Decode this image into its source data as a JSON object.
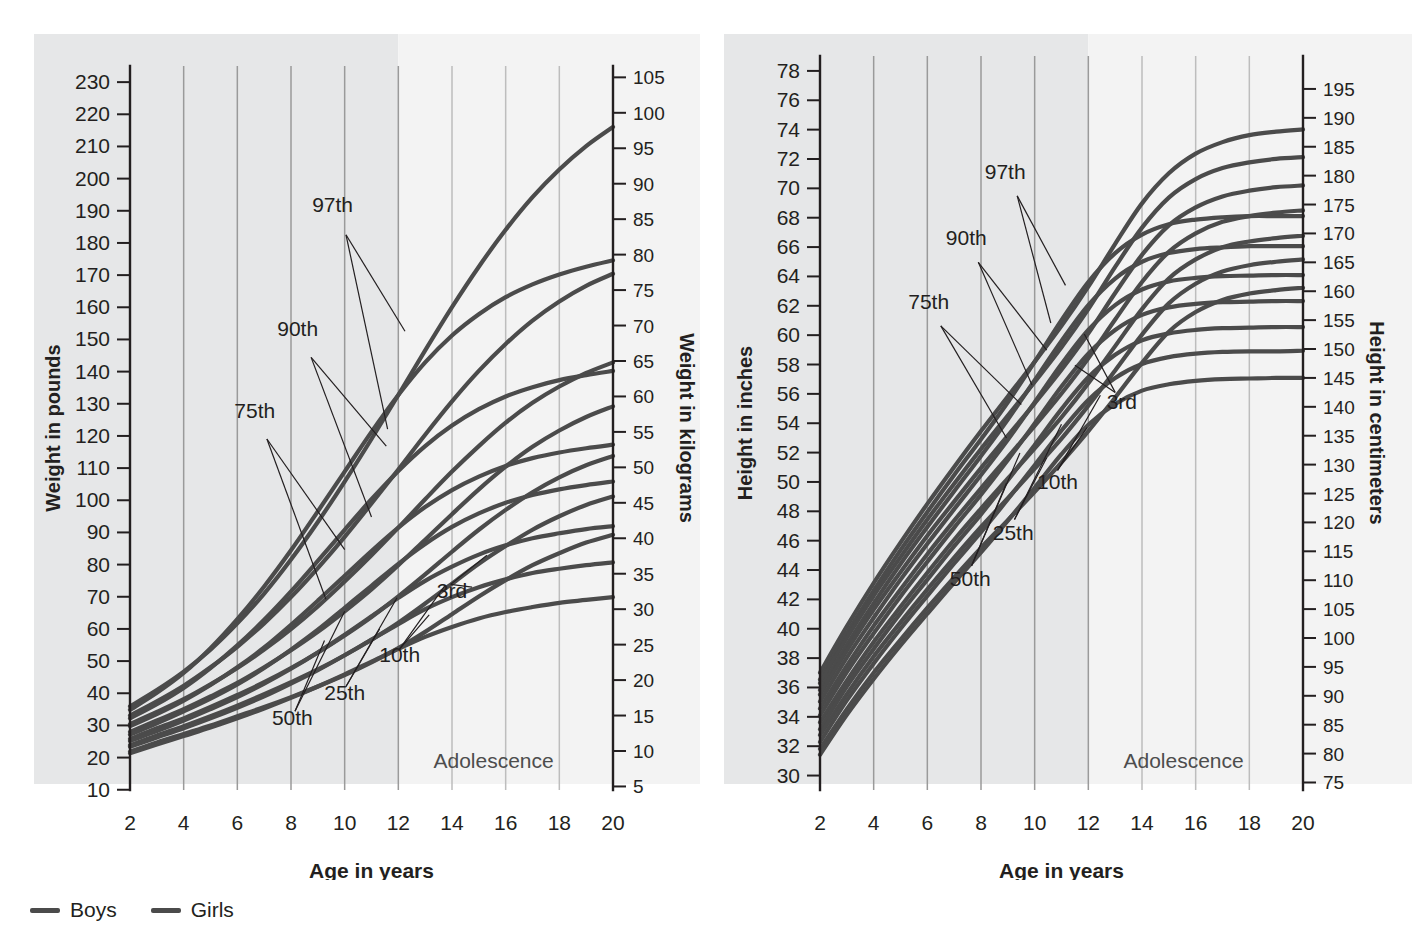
{
  "page": {
    "clipped_header_text": "",
    "background_color": "#ffffff"
  },
  "legend": {
    "items": [
      {
        "label": "Boys",
        "color": "#4b4b4b"
      },
      {
        "label": "Girls",
        "color": "#4b4b4b"
      }
    ]
  },
  "shared": {
    "x_title": "Age in years",
    "x_ticks": [
      2,
      4,
      6,
      8,
      10,
      12,
      14,
      16,
      18,
      20
    ],
    "adolescence_label": "Adolescence",
    "adolescence_range": [
      12,
      20
    ],
    "percentile_labels": [
      "97th",
      "90th",
      "75th",
      "50th",
      "25th",
      "10th",
      "3rd"
    ],
    "curve_color": "#4b4b4b",
    "grid_color": "#9a9a9a"
  },
  "chart_data": [
    {
      "type": "line",
      "id": "weight",
      "title": "",
      "xlabel": "Age in years",
      "ylabel": "Weight in pounds",
      "ylabel_right": "Height in kilograms",
      "y_right_label": "Weight in kilograms",
      "xlim": [
        2,
        20
      ],
      "ylim_lb": [
        10,
        235
      ],
      "ylim_kg": [
        4.5,
        106.6
      ],
      "x_ticks": [
        2,
        4,
        6,
        8,
        10,
        12,
        14,
        16,
        18,
        20
      ],
      "y_ticks_left": [
        10,
        20,
        30,
        40,
        50,
        60,
        70,
        80,
        90,
        100,
        110,
        120,
        130,
        140,
        150,
        160,
        170,
        180,
        190,
        200,
        210,
        220,
        230
      ],
      "y_ticks_right": [
        5,
        10,
        15,
        20,
        25,
        30,
        35,
        40,
        45,
        50,
        55,
        60,
        65,
        70,
        75,
        80,
        85,
        90,
        95,
        100,
        105
      ],
      "grid": true,
      "legend_position": "below-figure",
      "x": [
        2,
        3,
        4,
        5,
        6,
        7,
        8,
        9,
        10,
        11,
        12,
        13,
        14,
        15,
        16,
        17,
        18,
        19,
        20
      ],
      "series": [
        {
          "name": "Boys 97th",
          "sex": "Boys",
          "percentile": "97th",
          "unit": "kg",
          "values": [
            16.3,
            18.6,
            21.2,
            24.3,
            28.0,
            32.2,
            37.0,
            42.3,
            48.0,
            54.0,
            60.2,
            66.5,
            72.6,
            78.3,
            83.5,
            88.1,
            92.0,
            95.3,
            98.0
          ]
        },
        {
          "name": "Girls 97th",
          "sex": "Girls",
          "percentile": "97th",
          "unit": "kg",
          "values": [
            15.8,
            18.2,
            21.0,
            24.5,
            28.6,
            33.2,
            38.3,
            43.8,
            49.4,
            55.0,
            60.2,
            64.8,
            68.6,
            71.6,
            74.0,
            75.8,
            77.2,
            78.3,
            79.2
          ]
        },
        {
          "name": "Boys 90th",
          "sex": "Boys",
          "percentile": "90th",
          "unit": "kg",
          "values": [
            15.0,
            17.0,
            19.2,
            21.8,
            24.7,
            28.0,
            31.7,
            35.8,
            40.2,
            44.9,
            49.7,
            54.6,
            59.3,
            63.6,
            67.4,
            70.7,
            73.4,
            75.6,
            77.3
          ]
        },
        {
          "name": "Girls 90th",
          "sex": "Girls",
          "percentile": "90th",
          "unit": "kg",
          "values": [
            14.6,
            16.6,
            18.9,
            21.7,
            24.9,
            28.5,
            32.5,
            36.8,
            41.2,
            45.5,
            49.5,
            53.0,
            55.9,
            58.2,
            60.0,
            61.3,
            62.3,
            63.0,
            63.6
          ]
        },
        {
          "name": "Boys 75th",
          "sex": "Boys",
          "percentile": "75th",
          "unit": "kg",
          "values": [
            13.8,
            15.5,
            17.3,
            19.4,
            21.7,
            24.3,
            27.2,
            30.4,
            33.9,
            37.6,
            41.5,
            45.5,
            49.4,
            53.0,
            56.3,
            59.1,
            61.4,
            63.3,
            64.8
          ]
        },
        {
          "name": "Girls 75th",
          "sex": "Girls",
          "percentile": "75th",
          "unit": "kg",
          "values": [
            13.5,
            15.2,
            17.1,
            19.3,
            21.8,
            24.6,
            27.8,
            31.2,
            34.7,
            38.2,
            41.5,
            44.4,
            46.8,
            48.7,
            50.2,
            51.3,
            52.1,
            52.7,
            53.2
          ]
        },
        {
          "name": "Boys 50th",
          "sex": "Boys",
          "percentile": "50th",
          "unit": "kg",
          "values": [
            12.7,
            14.3,
            15.9,
            17.7,
            19.6,
            21.8,
            24.2,
            26.8,
            29.7,
            32.8,
            36.2,
            39.8,
            43.4,
            46.9,
            50.1,
            52.9,
            55.2,
            57.1,
            58.6
          ]
        },
        {
          "name": "Girls 50th",
          "sex": "Girls",
          "percentile": "50th",
          "unit": "kg",
          "values": [
            12.3,
            13.9,
            15.6,
            17.4,
            19.4,
            21.7,
            24.3,
            27.1,
            30.2,
            33.3,
            36.4,
            39.2,
            41.6,
            43.5,
            45.0,
            46.1,
            46.9,
            47.5,
            48.0
          ]
        },
        {
          "name": "Boys 25th",
          "sex": "Boys",
          "percentile": "25th",
          "unit": "kg",
          "values": [
            11.7,
            13.2,
            14.6,
            16.2,
            17.9,
            19.7,
            21.7,
            23.9,
            26.3,
            28.9,
            31.8,
            34.9,
            38.1,
            41.2,
            44.0,
            46.5,
            48.6,
            50.3,
            51.6
          ]
        },
        {
          "name": "Girls 25th",
          "sex": "Girls",
          "percentile": "25th",
          "unit": "kg",
          "values": [
            11.4,
            12.8,
            14.3,
            15.9,
            17.6,
            19.5,
            21.6,
            23.9,
            26.4,
            29.0,
            31.6,
            34.0,
            36.0,
            37.7,
            39.0,
            40.0,
            40.7,
            41.3,
            41.7
          ]
        },
        {
          "name": "Boys 10th",
          "sex": "Boys",
          "percentile": "10th",
          "unit": "kg",
          "values": [
            10.8,
            12.2,
            13.5,
            14.9,
            16.4,
            18.0,
            19.7,
            21.5,
            23.5,
            25.7,
            28.1,
            30.8,
            33.6,
            36.4,
            38.9,
            41.2,
            43.1,
            44.7,
            45.9
          ]
        },
        {
          "name": "Girls 10th",
          "sex": "Girls",
          "percentile": "10th",
          "unit": "kg",
          "values": [
            10.6,
            11.9,
            13.2,
            14.6,
            16.1,
            17.7,
            19.5,
            21.4,
            23.5,
            25.7,
            27.9,
            30.0,
            31.7,
            33.1,
            34.2,
            35.1,
            35.7,
            36.2,
            36.6
          ]
        },
        {
          "name": "Boys 3rd",
          "sex": "Boys",
          "percentile": "3rd",
          "unit": "kg",
          "values": [
            9.9,
            11.2,
            12.4,
            13.6,
            14.9,
            16.2,
            17.6,
            19.1,
            20.7,
            22.5,
            24.5,
            26.8,
            29.3,
            31.8,
            34.1,
            36.2,
            37.9,
            39.4,
            40.5
          ]
        },
        {
          "name": "Girls 3rd",
          "sex": "Girls",
          "percentile": "3rd",
          "unit": "kg",
          "values": [
            9.7,
            10.9,
            12.1,
            13.3,
            14.6,
            16.0,
            17.5,
            19.1,
            20.8,
            22.6,
            24.4,
            26.1,
            27.5,
            28.7,
            29.6,
            30.3,
            30.9,
            31.3,
            31.7
          ]
        }
      ]
    },
    {
      "type": "line",
      "id": "height",
      "title": "",
      "xlabel": "Age in years",
      "ylabel": "Height in inches",
      "y_right_label": "Height in centimeters",
      "xlim": [
        2,
        20
      ],
      "ylim_in": [
        29,
        79
      ],
      "ylim_cm": [
        73.7,
        200.7
      ],
      "x_ticks": [
        2,
        4,
        6,
        8,
        10,
        12,
        14,
        16,
        18,
        20
      ],
      "y_ticks_left": [
        30,
        32,
        34,
        36,
        38,
        40,
        42,
        44,
        46,
        48,
        50,
        52,
        54,
        56,
        58,
        60,
        62,
        64,
        66,
        68,
        70,
        72,
        74,
        76,
        78
      ],
      "y_ticks_right": [
        75,
        80,
        85,
        90,
        95,
        100,
        105,
        110,
        115,
        120,
        125,
        130,
        135,
        140,
        145,
        150,
        155,
        160,
        165,
        170,
        175,
        180,
        185,
        190,
        195
      ],
      "grid": true,
      "legend_position": "below-figure",
      "x": [
        2,
        3,
        4,
        5,
        6,
        7,
        8,
        9,
        10,
        11,
        12,
        13,
        14,
        15,
        16,
        17,
        18,
        19,
        20
      ],
      "series": [
        {
          "name": "Boys 97th",
          "sex": "Boys",
          "percentile": "97th",
          "unit": "cm",
          "values": [
            94.0,
            102.0,
            109.5,
            116.5,
            123.2,
            129.6,
            135.8,
            141.8,
            147.8,
            154.0,
            160.8,
            168.2,
            175.2,
            180.4,
            183.8,
            185.8,
            187.0,
            187.6,
            188.0
          ]
        },
        {
          "name": "Girls 97th",
          "sex": "Girls",
          "percentile": "97th",
          "unit": "cm",
          "values": [
            92.8,
            100.8,
            108.2,
            115.2,
            121.8,
            128.2,
            134.4,
            140.8,
            147.8,
            155.0,
            161.6,
            166.6,
            169.8,
            171.6,
            172.4,
            172.8,
            173.0,
            173.0,
            173.0
          ]
        },
        {
          "name": "Boys 90th",
          "sex": "Boys",
          "percentile": "90th",
          "unit": "cm",
          "values": [
            92.2,
            100.0,
            107.3,
            114.0,
            120.5,
            126.7,
            132.7,
            138.5,
            144.3,
            150.3,
            156.9,
            164.2,
            171.0,
            176.2,
            179.4,
            181.3,
            182.3,
            182.9,
            183.2
          ]
        },
        {
          "name": "Girls 90th",
          "sex": "Girls",
          "percentile": "90th",
          "unit": "cm",
          "values": [
            91.0,
            98.8,
            106.0,
            112.8,
            119.2,
            125.4,
            131.5,
            137.8,
            144.6,
            151.4,
            157.6,
            162.2,
            165.1,
            166.6,
            167.3,
            167.6,
            167.8,
            167.8,
            167.8
          ]
        },
        {
          "name": "Boys 75th",
          "sex": "Boys",
          "percentile": "75th",
          "unit": "cm",
          "values": [
            90.2,
            97.8,
            104.9,
            111.4,
            117.7,
            123.6,
            129.4,
            135.0,
            140.6,
            146.4,
            152.7,
            159.7,
            166.3,
            171.4,
            174.5,
            176.4,
            177.4,
            178.0,
            178.3
          ]
        },
        {
          "name": "Girls 75th",
          "sex": "Girls",
          "percentile": "75th",
          "unit": "cm",
          "values": [
            89.0,
            96.6,
            103.5,
            110.1,
            116.3,
            122.3,
            128.2,
            134.3,
            140.8,
            147.4,
            153.3,
            157.6,
            160.3,
            161.7,
            162.3,
            162.6,
            162.7,
            162.8,
            162.8
          ]
        },
        {
          "name": "Boys 50th",
          "sex": "Boys",
          "percentile": "50th",
          "unit": "cm",
          "values": [
            87.8,
            95.2,
            102.1,
            108.4,
            114.5,
            120.3,
            125.9,
            131.3,
            136.7,
            142.3,
            148.4,
            155.1,
            161.6,
            166.8,
            170.0,
            172.0,
            173.0,
            173.6,
            174.0
          ]
        },
        {
          "name": "Girls 50th",
          "sex": "Girls",
          "percentile": "50th",
          "unit": "cm",
          "values": [
            86.6,
            94.1,
            100.8,
            107.2,
            113.2,
            119.1,
            124.8,
            130.8,
            137.1,
            143.5,
            149.2,
            153.3,
            155.9,
            157.2,
            157.8,
            158.1,
            158.2,
            158.3,
            158.3
          ]
        },
        {
          "name": "Boys 25th",
          "sex": "Boys",
          "percentile": "25th",
          "unit": "cm",
          "values": [
            85.4,
            92.6,
            99.3,
            105.4,
            111.3,
            117.0,
            122.4,
            127.6,
            132.8,
            138.2,
            144.1,
            150.5,
            156.9,
            162.2,
            165.5,
            167.6,
            168.6,
            169.2,
            169.6
          ]
        },
        {
          "name": "Girls 25th",
          "sex": "Girls",
          "percentile": "25th",
          "unit": "cm",
          "values": [
            84.2,
            91.6,
            98.1,
            104.3,
            110.1,
            115.9,
            121.4,
            127.3,
            133.4,
            139.6,
            145.1,
            149.0,
            151.5,
            152.7,
            153.3,
            153.6,
            153.7,
            153.8,
            153.8
          ]
        },
        {
          "name": "Boys 10th",
          "sex": "Boys",
          "percentile": "10th",
          "unit": "cm",
          "values": [
            83.2,
            90.3,
            96.8,
            102.7,
            108.4,
            113.9,
            119.2,
            124.2,
            129.3,
            134.5,
            140.2,
            146.3,
            152.5,
            157.9,
            161.3,
            163.4,
            164.5,
            165.1,
            165.5
          ]
        },
        {
          "name": "Girls 10th",
          "sex": "Girls",
          "percentile": "10th",
          "unit": "cm",
          "values": [
            82.0,
            89.2,
            95.6,
            101.6,
            107.3,
            112.9,
            118.3,
            124.0,
            129.9,
            135.9,
            141.2,
            145.0,
            147.4,
            148.6,
            149.2,
            149.5,
            149.6,
            149.6,
            149.7
          ]
        },
        {
          "name": "Boys 3rd",
          "sex": "Boys",
          "percentile": "3rd",
          "unit": "cm",
          "values": [
            80.8,
            87.7,
            94.0,
            99.7,
            105.2,
            110.5,
            115.6,
            120.4,
            125.3,
            130.4,
            135.8,
            141.6,
            147.6,
            153.0,
            156.4,
            158.5,
            159.6,
            160.2,
            160.6
          ]
        },
        {
          "name": "Girls 3rd",
          "sex": "Girls",
          "percentile": "3rd",
          "unit": "cm",
          "values": [
            79.8,
            86.7,
            92.9,
            98.7,
            104.2,
            109.6,
            114.8,
            120.3,
            126.0,
            131.8,
            136.9,
            140.5,
            142.8,
            143.9,
            144.5,
            144.8,
            144.9,
            145.0,
            145.0
          ]
        }
      ]
    }
  ]
}
